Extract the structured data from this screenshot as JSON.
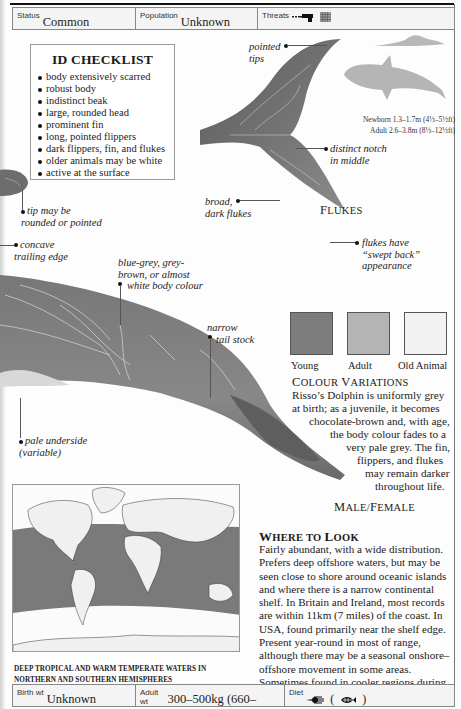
{
  "header": {
    "status_label": "Status",
    "status_value": "Common",
    "population_label": "Population",
    "population_value": "Unknown",
    "threats_label": "Threats",
    "threat_icons": [
      "gun-harpoon-icon",
      "fishing-net-icon"
    ]
  },
  "checklist": {
    "title": "ID CHECKLIST",
    "items": [
      "body extensively scarred",
      "robust body",
      "indistinct beak",
      "large, rounded head",
      "prominent fin",
      "long, pointed flippers",
      "dark flippers, fin, and flukes",
      "older animals may be white",
      "active at the surface"
    ]
  },
  "annotations": {
    "pointed_tips": [
      "pointed",
      "tips"
    ],
    "distinct_notch": [
      "distinct notch",
      "in middle"
    ],
    "broad_dark_flukes": [
      "broad,",
      "dark flukes"
    ],
    "swept_back": [
      "flukes have",
      "“swept back”",
      "appearance"
    ],
    "tip_rounded": [
      "tip may be",
      "rounded or pointed"
    ],
    "concave_edge": [
      "concave",
      "trailing edge"
    ],
    "body_colour": [
      "blue-grey, grey-",
      "brown, or almost",
      "white body colour"
    ],
    "tail_stock": [
      "narrow",
      "tail stock"
    ],
    "pale_underside": [
      "pale underside",
      "(variable)"
    ]
  },
  "flukes_caption": {
    "first": "F",
    "rest": "LUKES"
  },
  "sizes": {
    "newborn": "Newborn 1.3–1.7m (4½–5½ft)",
    "adult": "Adult 2.6–3.8m (8½–12½ft)"
  },
  "colour_variations": {
    "swatches": [
      {
        "label": "Young",
        "color": "#7d7d7d"
      },
      {
        "label": "Adult",
        "color": "#b4b4b4"
      },
      {
        "label": "Old Animal",
        "color": "#f2f2f2"
      }
    ],
    "title_first_1": "C",
    "title_rest_1": "OLOUR ",
    "title_first_2": "V",
    "title_rest_2": "ARIATIONS",
    "lines": [
      "Risso’s Dolphin is uniformly grey",
      "at birth; as a juvenile, it becomes",
      "chocolate-brown and, with age,",
      "the body colour fades to a",
      "very pale grey. The fin,",
      "flippers, and flukes",
      "may remain darker",
      "throughout life."
    ]
  },
  "male_female_caption": {
    "m": "M",
    "ale": "ALE/",
    "f": "F",
    "emale": "EMALE"
  },
  "map": {
    "caption_line1": "DEEP TROPICAL AND WARM TEMPERATE WATERS IN",
    "caption_line2": "NORTHERN AND SOUTHERN HEMISPHERES",
    "range_color": "#7a7a7a",
    "land_color": "#f0f0f0"
  },
  "where_to_look": {
    "title_first_1": "W",
    "title_rest_1": "HERE TO ",
    "title_first_2": "L",
    "title_rest_2": "OOK",
    "text": "Fairly abundant, with a wide distribution. Prefers deep offshore waters, but may be seen close to shore around oceanic islands and where there is a narrow continental shelf. In Britain and Ireland, most records are within 11km (7 miles) of the coast. In USA, found primarily near the shelf edge. Present year-round in most of range, although there may be a seasonal onshore–offshore movement in some areas. Sometimes found in cooler regions during summer months."
  },
  "footer": {
    "birth_wt_label": "Birth wt",
    "birth_wt_value": "Unknown",
    "adult_wt_label": "Adult wt",
    "adult_wt_value": "300–500kg (660–1,100lb)",
    "diet_label": "Diet",
    "diet_icons": [
      "squid-icon",
      "fish-icon"
    ],
    "diet_paren_open": "(",
    "diet_paren_close": ")"
  }
}
